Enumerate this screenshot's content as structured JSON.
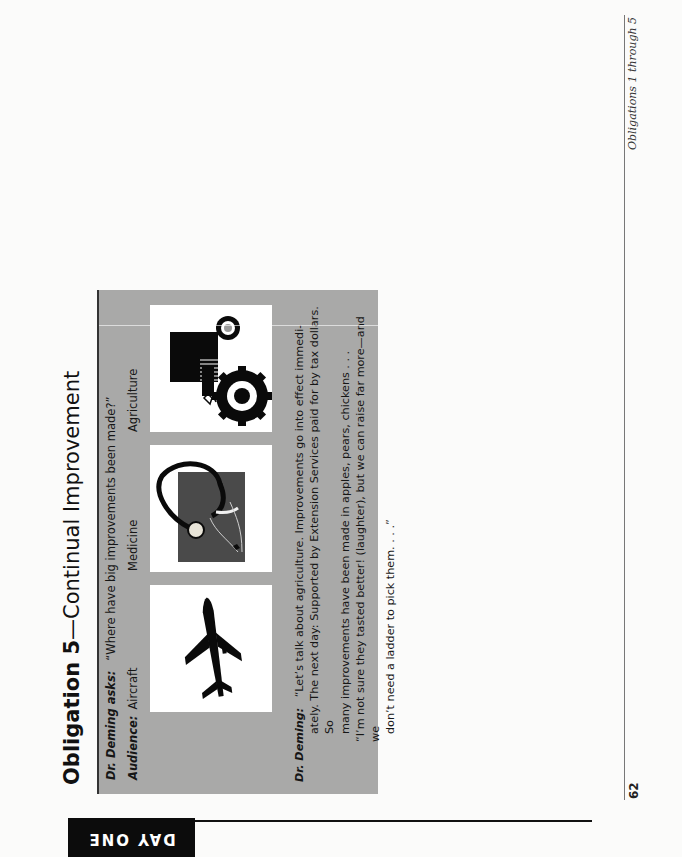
{
  "page": {
    "section_tab": "DAY ONE",
    "page_number": "62",
    "running_head": "Obligations 1 through 5",
    "title": {
      "number": "Obligation 5",
      "dash": "—",
      "name": "Continual Improvement"
    }
  },
  "dialogue": {
    "asks_label": "Dr. Deming asks:",
    "asks_text": "“Where have big improvements been made?”",
    "audience_label": "Audience:",
    "answers": [
      {
        "label": "Aircraft",
        "icon": "airplane-icon"
      },
      {
        "label": "Medicine",
        "icon": "stethoscope-icon"
      },
      {
        "label": "Agriculture",
        "icon": "tractor-icon"
      }
    ],
    "response_label": "Dr. Deming:",
    "response_lines": [
      "“Let’s talk about agriculture. Improvements go into effect immedi-",
      "ately. The next day: Supported by Extension Services paid for by tax dollars. So",
      "many improvements have been made in apples, pears, chickens . . .",
      "“I’m not sure they tasted better! (laughter), but we can raise far more—and we",
      "don’t need a ladder to pick them. . . .”"
    ]
  },
  "colors": {
    "box_gray": "#a9a9a8",
    "tab_black": "#0c0c0c",
    "page_bg": "#fbfbfa"
  }
}
